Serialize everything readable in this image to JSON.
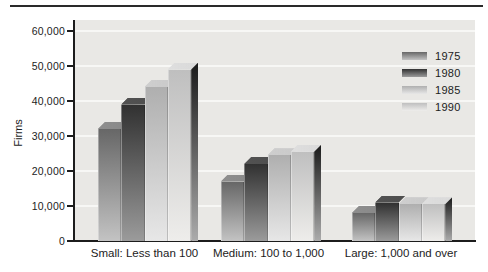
{
  "figure": {
    "kind": "3d-grouped-bar-chart",
    "y_axis_title": "Firms"
  },
  "chart_data": {
    "type": "bar",
    "bar_style": "3d-column",
    "title": "",
    "xlabel": "",
    "ylabel": "Firms",
    "categories": [
      "Small: Less than 100",
      "Medium: 100 to 1,000",
      "Large: 1,000 and over"
    ],
    "series": [
      {
        "name": "1975",
        "values": [
          32000,
          17000,
          8000
        ]
      },
      {
        "name": "1980",
        "values": [
          39000,
          22000,
          11000
        ]
      },
      {
        "name": "1985",
        "values": [
          44000,
          24500,
          10500
        ]
      },
      {
        "name": "1990",
        "values": [
          49000,
          25500,
          10500
        ]
      }
    ],
    "ylim": [
      0,
      60000
    ],
    "ytick_interval": 10000,
    "ytick_labels": [
      "0",
      "10,000",
      "20,000",
      "30,000",
      "40,000",
      "50,000",
      "60,000"
    ],
    "grid": true,
    "legend_position": "upper-right-inside",
    "legend_entries": [
      "1975",
      "1980",
      "1985",
      "1990"
    ]
  },
  "colors": {
    "page_background": "#ffffff",
    "plot_background": "#e9e8e5",
    "gridline": "#f7f7f5",
    "axis": "#1c1c1c",
    "text": "#1c1c1c",
    "top_rule": "#2a2a2a",
    "series": [
      {
        "name": "1975",
        "front_top": "#676767",
        "front_bottom": "#c3c3c3",
        "top_face": "#8e8e8e"
      },
      {
        "name": "1980",
        "front_top": "#313131",
        "front_bottom": "#9b9b9b",
        "top_face": "#525252"
      },
      {
        "name": "1985",
        "front_top": "#afafaf",
        "front_bottom": "#e7e7e7",
        "top_face": "#cecece"
      },
      {
        "name": "1990",
        "front_top": "#bfbfbf",
        "front_bottom": "#eeedeb",
        "top_face": "#dedede"
      }
    ],
    "side_face_top": "#1a1a1a",
    "side_face_bottom": "#ababab"
  }
}
